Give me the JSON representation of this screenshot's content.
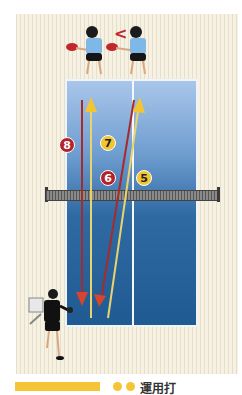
{
  "illustration": {
    "subject": "table tennis footwork drill diagram",
    "table_color": "#2f6aa3",
    "background_color": "#f6f1e3",
    "direction_marker": "<",
    "routes": [
      {
        "number": "5",
        "color": "#f2c531",
        "type": "yellow"
      },
      {
        "number": "6",
        "color": "#b4232a",
        "type": "red"
      },
      {
        "number": "7",
        "color": "#f2c531",
        "type": "yellow"
      },
      {
        "number": "8",
        "color": "#b4232a",
        "type": "red"
      }
    ]
  },
  "caption": {
    "text": "運用打",
    "bar_color": "#f6c537"
  }
}
